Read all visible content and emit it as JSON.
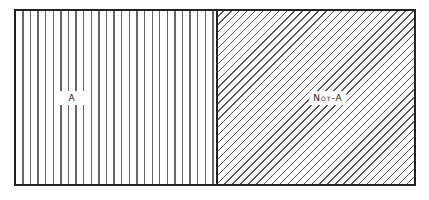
{
  "diagram": {
    "type": "partition",
    "regions": [
      {
        "id": "a",
        "label": "A",
        "pattern": "vertical-lines"
      },
      {
        "id": "not-a",
        "label": "Not-A",
        "pattern": "diagonal-lines"
      }
    ],
    "colors": {
      "border": "#222222",
      "hatch": "#666666",
      "background": "#ffffff"
    }
  }
}
